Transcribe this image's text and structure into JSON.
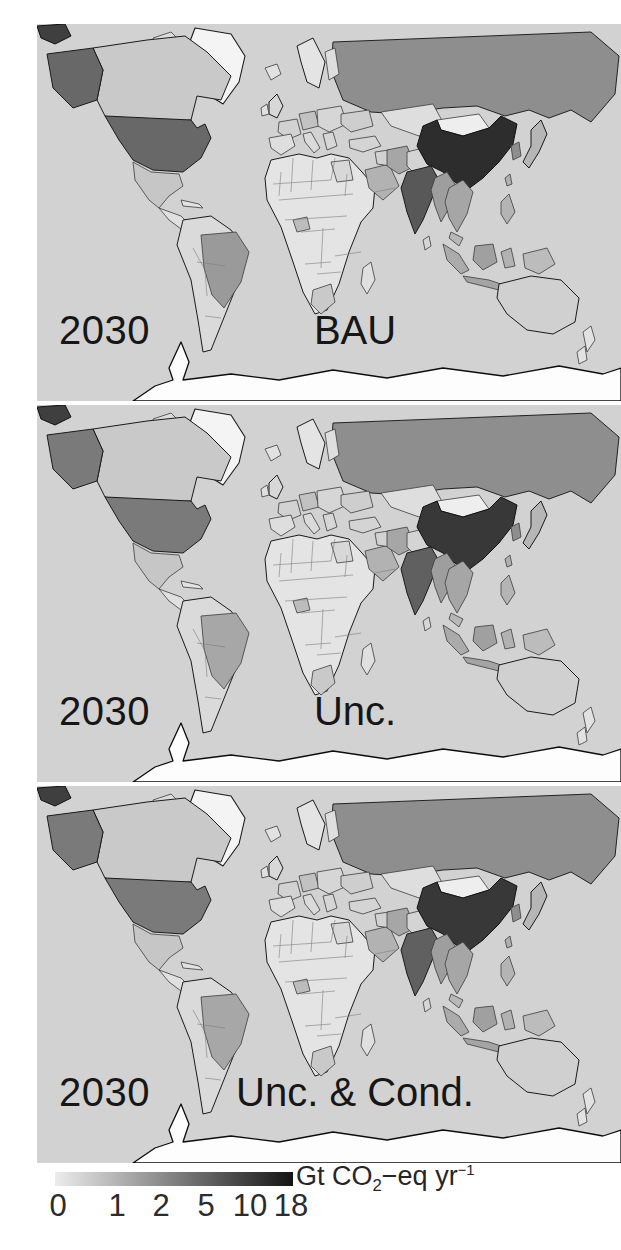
{
  "panels": [
    {
      "year_label": "2030",
      "scenario_label": "BAU"
    },
    {
      "year_label": "2030",
      "scenario_label": "Unc."
    },
    {
      "year_label": "2030",
      "scenario_label": "Unc. & Cond."
    }
  ],
  "colorbar": {
    "tick_labels": [
      "0",
      "1",
      "2",
      "5",
      "10",
      "18"
    ],
    "unit_prefix": "Gt CO",
    "unit_sub": "2",
    "unit_mid": "−eq yr",
    "unit_sup": "−1",
    "gradient_start": "#ececec",
    "gradient_end": "#141414"
  },
  "colors": {
    "background": "#ffffff",
    "ocean": "#d2d2d2",
    "land_default": "#e3e3e3",
    "coastline": "#3c3c3c",
    "inner_border": "#7d7d7d",
    "text": "#161616"
  },
  "countries": [
    {
      "key": "antarctica",
      "name": "Antarctica",
      "fill": "#fdfdfd"
    },
    {
      "key": "arctic_fragment",
      "name": "Siberia wrap edge",
      "fill": "#3f3f3f"
    },
    {
      "key": "greenland",
      "name": "Greenland",
      "fill": "#f4f4f4"
    },
    {
      "key": "arctic_isl1",
      "name": "Arctic islands",
      "fill": "#dcdcdc"
    },
    {
      "key": "arctic_isl2",
      "name": "Arctic islands",
      "fill": "#dcdcdc"
    },
    {
      "key": "iceland",
      "name": "Iceland",
      "fill": "#e2e2e2"
    },
    {
      "key": "russia",
      "name": "Russia",
      "fill": "#8e8e8e",
      "value_gt": 2.5
    },
    {
      "key": "kazakh",
      "name": "Kazakhstan",
      "fill": "#dedede",
      "value_gt": 0.4
    },
    {
      "key": "scandinavia",
      "name": "Norway/Sweden",
      "fill": "#e4e4e4",
      "value_gt": 0.2
    },
    {
      "key": "finland",
      "name": "Finland",
      "fill": "#dedede",
      "value_gt": 0.2
    },
    {
      "key": "alaska",
      "name": "United States (Alaska)",
      "fill": [
        "#686868",
        "#7a7a7a",
        "#7a7a7a"
      ],
      "value_gt": [
        6,
        5,
        5
      ]
    },
    {
      "key": "canada",
      "name": "Canada",
      "fill": "#c9c9c9",
      "value_gt": 0.8
    },
    {
      "key": "usa",
      "name": "United States",
      "fill": [
        "#686868",
        "#7a7a7a",
        "#7a7a7a"
      ],
      "value_gt": [
        6,
        5,
        5
      ]
    },
    {
      "key": "mexico",
      "name": "Mexico",
      "fill": "#c6c6c6",
      "value_gt": 0.8
    },
    {
      "key": "camerica",
      "name": "Central America",
      "fill": "#e0e0e0"
    },
    {
      "key": "cuba",
      "name": "Caribbean",
      "fill": "#e2e2e2"
    },
    {
      "key": "samerica",
      "name": "South America (other)",
      "fill": "#dadada",
      "value_gt": 0.4
    },
    {
      "key": "brazil",
      "name": "Brazil",
      "fill": [
        "#9a9a9a",
        "#a7a7a7",
        "#a7a7a7"
      ],
      "value_gt": [
        2,
        1.6,
        1.6
      ]
    },
    {
      "key": "uk",
      "name": "United Kingdom",
      "fill": "#d8d8d8",
      "value_gt": 0.5
    },
    {
      "key": "ireland",
      "name": "Ireland",
      "fill": "#e0e0e0"
    },
    {
      "key": "france",
      "name": "France",
      "fill": "#d2d2d2",
      "value_gt": 0.5
    },
    {
      "key": "iberia",
      "name": "Spain/Portugal",
      "fill": "#dedede",
      "value_gt": 0.4
    },
    {
      "key": "germany",
      "name": "Germany",
      "fill": "#c2c2c2",
      "value_gt": 1
    },
    {
      "key": "easteu",
      "name": "Central/Eastern Europe",
      "fill": "#d6d6d6",
      "value_gt": 0.4
    },
    {
      "key": "ukraine",
      "name": "Ukraine",
      "fill": "#cecece",
      "value_gt": 0.6
    },
    {
      "key": "italy",
      "name": "Italy",
      "fill": "#dadada",
      "value_gt": 0.5
    },
    {
      "key": "balkans",
      "name": "Balkans",
      "fill": "#d6d6d6"
    },
    {
      "key": "turkey",
      "name": "Turkey",
      "fill": "#d4d4d4",
      "value_gt": 0.6
    },
    {
      "key": "africa",
      "name": "Africa (most countries)",
      "fill": "#e4e4e4",
      "value_gt": 0.2
    },
    {
      "key": "egypt",
      "name": "Egypt",
      "fill": "#d8d8d8",
      "value_gt": 0.4
    },
    {
      "key": "nigeria",
      "name": "Nigeria",
      "fill": "#bcbcbc",
      "value_gt": 0.9
    },
    {
      "key": "southafrica",
      "name": "South Africa",
      "fill": "#c9c9c9",
      "value_gt": 0.8
    },
    {
      "key": "madagascar",
      "name": "Madagascar",
      "fill": "#e0e0e0"
    },
    {
      "key": "arabia",
      "name": "Saudi Arabia",
      "fill": "#b2b2b2",
      "value_gt": 1.2
    },
    {
      "key": "iraq",
      "name": "Iraq/Syria",
      "fill": "#d2d2d2"
    },
    {
      "key": "iran",
      "name": "Iran",
      "fill": "#a6a6a6",
      "value_gt": 1.5
    },
    {
      "key": "afghanpak",
      "name": "Afghanistan/Pakistan",
      "fill": "#d4d4d4",
      "value_gt": 0.5
    },
    {
      "key": "mongolia",
      "name": "Mongolia",
      "fill": "#eeeeee",
      "value_gt": 0.1
    },
    {
      "key": "china",
      "name": "China",
      "fill": [
        "#2d2d2d",
        "#383838",
        "#383838"
      ],
      "value_gt": [
        15,
        13,
        12.5
      ]
    },
    {
      "key": "korea",
      "name": "South Korea",
      "fill": "#8e8e8e",
      "value_gt": 2
    },
    {
      "key": "japan",
      "name": "Japan",
      "fill": "#b6b6b6",
      "value_gt": 1.2
    },
    {
      "key": "taiwan",
      "name": "Taiwan",
      "fill": "#b0b0b0"
    },
    {
      "key": "india",
      "name": "India",
      "fill": [
        "#585858",
        "#606060",
        "#606060"
      ],
      "value_gt": [
        5,
        4.5,
        4.5
      ]
    },
    {
      "key": "srilanka",
      "name": "Sri Lanka",
      "fill": "#d6d6d6"
    },
    {
      "key": "myanmar",
      "name": "Myanmar/Bangladesh",
      "fill": "#9e9e9e",
      "value_gt": 1.8
    },
    {
      "key": "thaiviet",
      "name": "Thailand/Vietnam",
      "fill": "#a6a6a6",
      "value_gt": 1.5
    },
    {
      "key": "malaysia",
      "name": "Malaysia",
      "fill": "#b8b8b8",
      "value_gt": 1
    },
    {
      "key": "sumatra",
      "name": "Indonesia (Sumatra)",
      "fill": "#ababab",
      "value_gt": 1.8
    },
    {
      "key": "borneo",
      "name": "Indonesia (Borneo)",
      "fill": "#a0a0a0",
      "value_gt": 1.8
    },
    {
      "key": "java",
      "name": "Indonesia (Java)",
      "fill": "#a4a4a4",
      "value_gt": 1.8
    },
    {
      "key": "sulawesi",
      "name": "Indonesia (Sulawesi)",
      "fill": "#b2b2b2"
    },
    {
      "key": "newguinea",
      "name": "Papua New Guinea",
      "fill": "#bcbcbc"
    },
    {
      "key": "philippines",
      "name": "Philippines",
      "fill": "#b4b4b4",
      "value_gt": 0.9
    },
    {
      "key": "australia",
      "name": "Australia",
      "fill": "#d0d0d0",
      "value_gt": 0.6
    },
    {
      "key": "nz1",
      "name": "New Zealand (North)",
      "fill": "#e2e2e2"
    },
    {
      "key": "nz2",
      "name": "New Zealand (South)",
      "fill": "#e2e2e2"
    }
  ],
  "chart_data": {
    "type": "heatmap",
    "subtype": "choropleth_world_map_small_multiples",
    "title": "",
    "year": "2030",
    "scenarios": [
      "BAU",
      "Unc.",
      "Unc. & Cond."
    ],
    "unit": "Gt CO2-eq yr-1",
    "color_scale": {
      "ticks": [
        0,
        1,
        2,
        5,
        10,
        18
      ],
      "from": "#ececec",
      "to": "#141414",
      "orientation": "horizontal"
    },
    "legend_position": "bottom",
    "series": [
      {
        "name": "BAU",
        "values": {
          "China": 15,
          "United States": 6,
          "India": 5,
          "Russia": 2.5,
          "South Korea": 2,
          "Brazil": 2,
          "Indonesia": 1.8,
          "Myanmar/Bangladesh": 1.8,
          "Iran": 1.5,
          "Thailand/Vietnam": 1.5,
          "Japan": 1.2,
          "Saudi Arabia": 1.2,
          "Germany": 1,
          "Nigeria": 0.9,
          "Canada": 0.8,
          "Mexico": 0.8,
          "South Africa": 0.8,
          "Australia": 0.6,
          "Most of Africa": 0.2,
          "Mongolia": 0.1
        }
      },
      {
        "name": "Unc.",
        "values": {
          "China": 13,
          "United States": 5,
          "India": 4.5,
          "Russia": 2.5,
          "South Korea": 2,
          "Brazil": 1.6,
          "Indonesia": 1.8,
          "Myanmar/Bangladesh": 1.8,
          "Iran": 1.5,
          "Thailand/Vietnam": 1.5,
          "Japan": 1.2,
          "Saudi Arabia": 1.2,
          "Germany": 1,
          "Nigeria": 0.9,
          "Canada": 0.8,
          "Mexico": 0.8,
          "South Africa": 0.8,
          "Australia": 0.6,
          "Most of Africa": 0.2,
          "Mongolia": 0.1
        }
      },
      {
        "name": "Unc. & Cond.",
        "values": {
          "China": 12.5,
          "United States": 5,
          "India": 4.5,
          "Russia": 2.5,
          "South Korea": 2,
          "Brazil": 1.6,
          "Indonesia": 1.8,
          "Myanmar/Bangladesh": 1.8,
          "Iran": 1.5,
          "Thailand/Vietnam": 1.5,
          "Japan": 1.2,
          "Saudi Arabia": 1.2,
          "Germany": 1,
          "Nigeria": 0.9,
          "Canada": 0.8,
          "Mexico": 0.8,
          "South Africa": 0.8,
          "Australia": 0.6,
          "Most of Africa": 0.2,
          "Mongolia": 0.1
        }
      }
    ]
  }
}
